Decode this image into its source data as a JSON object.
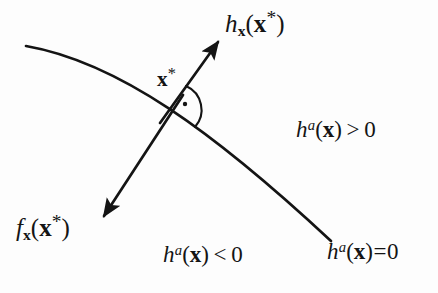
{
  "figure": {
    "background_color": "#fdfdfd",
    "ink_color": "#141414",
    "labels": {
      "h_gradient": {
        "text": "h_x(x*)",
        "base": "h",
        "subscript": "x",
        "open_paren": "(",
        "argument": "x",
        "argument_superscript": "*",
        "close_paren": ")"
      },
      "f_gradient": {
        "text": "f_x(x*)",
        "base": "f",
        "subscript": "x",
        "open_paren": "(",
        "argument": "x",
        "argument_superscript": "*",
        "close_paren": ")"
      },
      "optimum_point": {
        "text": "x*",
        "base": "x",
        "superscript": "*"
      },
      "region_positive": {
        "text": "h^a(x) > 0",
        "base": "h",
        "superscript": "a",
        "open_paren": "(",
        "argument": "x",
        "close_paren": ")",
        "operator": ">",
        "value": "0"
      },
      "region_negative": {
        "text": "h^a(x) < 0",
        "base": "h",
        "superscript": "a",
        "open_paren": "(",
        "argument": "x",
        "close_paren": ")",
        "operator": "<",
        "value": "0"
      },
      "boundary_curve": {
        "text": "h^a(x)=0",
        "base": "h",
        "superscript": "a",
        "open_paren": "(",
        "argument": "x",
        "close_paren": ")",
        "operator": "=",
        "value": "0"
      }
    },
    "geometry": {
      "constraint_curve": {
        "name": "h^a(x)=0",
        "start": [
          26,
          46
        ],
        "control_1": [
          118,
          62
        ],
        "control_2": [
          214,
          132
        ],
        "end": [
          331,
          241
        ],
        "stroke_width": 2.6
      },
      "gradient_h_arrow": {
        "name": "h_x(x*)",
        "from": [
          160,
          122
        ],
        "to": [
          221,
          38
        ],
        "stroke_width": 2.6,
        "arrowhead": "filled"
      },
      "gradient_f_arrow": {
        "name": "f_x(x*)",
        "from": [
          182,
          96
        ],
        "to": [
          100,
          221
        ],
        "stroke_width": 2.6,
        "arrowhead": "filled"
      },
      "intersection_point": [
        172,
        110
      ],
      "right_angle_marker": {
        "name": "perpendicularity-marker",
        "center": [
          172,
          110
        ],
        "radius": 26,
        "dot_offset": [
          13,
          -7
        ],
        "dot_radius": 2.1
      }
    }
  }
}
